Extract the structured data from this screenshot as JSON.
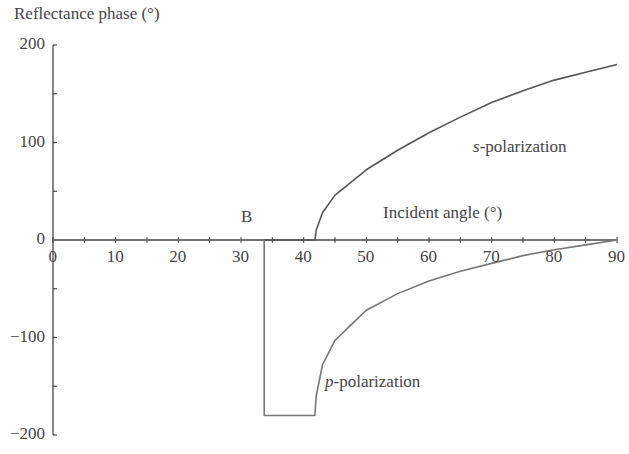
{
  "chart_data": {
    "type": "line",
    "title": "",
    "ylabel": "Reflectance phase (°)",
    "xlabel": "Incident angle (°)",
    "xlim": [
      0,
      90
    ],
    "ylim": [
      -200,
      200
    ],
    "x_ticks": [
      "0",
      "10",
      "20",
      "30",
      "40",
      "50",
      "60",
      "70",
      "80",
      "90"
    ],
    "y_ticks": [
      "200",
      "100",
      "0",
      "−100",
      "−200"
    ],
    "grid": false,
    "annotations": [
      {
        "text": "B",
        "x": 33.7,
        "y": 20
      },
      {
        "text": "s-polarization",
        "x": 75,
        "y": 95
      },
      {
        "text": "p-polarization",
        "x": 45,
        "y": -145
      }
    ],
    "series": [
      {
        "name": "s-polarization",
        "x": [
          0,
          41.8,
          42,
          43,
          45,
          50,
          55,
          60,
          65,
          70,
          75,
          80,
          85,
          90
        ],
        "y": [
          0,
          0,
          10,
          28,
          46,
          72,
          92,
          110,
          126,
          141,
          153,
          164,
          172,
          180
        ]
      },
      {
        "name": "p-polarization",
        "x": [
          0,
          33.7,
          33.7,
          41.8,
          42,
          43,
          45,
          50,
          55,
          60,
          65,
          70,
          75,
          80,
          85,
          90
        ],
        "y": [
          0,
          0,
          -180,
          -180,
          -160,
          -128,
          -103,
          -72,
          -55,
          -42,
          -32,
          -24,
          -16,
          -10,
          -5,
          0
        ]
      }
    ]
  },
  "labels": {
    "ylabel": "Reflectance phase (°)",
    "xlabel": "Incident angle (°)",
    "brewster": "B",
    "s_pre": "s",
    "s_post": "-polarization",
    "p_pre": "p",
    "p_post": "-polarization"
  }
}
